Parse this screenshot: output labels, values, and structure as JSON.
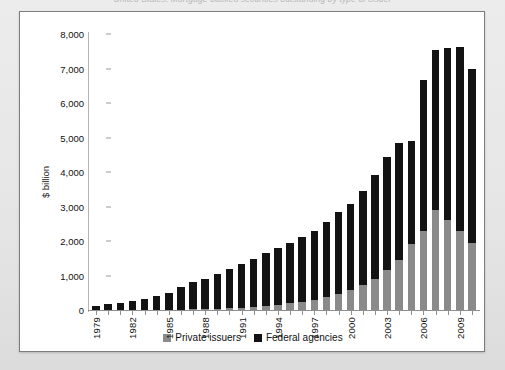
{
  "page": {
    "clipped_caption": "United States: Mortgage-backed securities outstanding by type of issuer"
  },
  "chart_data": {
    "type": "bar",
    "stacked": true,
    "title": "",
    "xlabel": "",
    "ylabel": "$ billion",
    "ylim": [
      0,
      8000
    ],
    "yticks": [
      0,
      1000,
      2000,
      3000,
      4000,
      5000,
      6000,
      7000,
      8000
    ],
    "ytick_labels": [
      "0",
      "1,000",
      "2,000",
      "3,000",
      "4,000",
      "5,000",
      "6,000",
      "7,000",
      "8,000"
    ],
    "grid": false,
    "legend_position": "bottom",
    "categories": [
      "1979",
      "1980",
      "1981",
      "1982",
      "1983",
      "1984",
      "1985",
      "1986",
      "1987",
      "1988",
      "1989",
      "1990",
      "1991",
      "1992",
      "1993",
      "1994",
      "1995",
      "1996",
      "1997",
      "1998",
      "1999",
      "2000",
      "2001",
      "2002",
      "2003",
      "2004",
      "2005",
      "2006",
      "2007",
      "2008",
      "2009",
      "2010"
    ],
    "xtick_labels": [
      "1979",
      "1982",
      "1985",
      "1988",
      "1991",
      "1994",
      "1997",
      "2000",
      "2003",
      "2006",
      "2009"
    ],
    "series": [
      {
        "name": "Private issuers",
        "color": "#8a8a8a",
        "values": [
          0,
          0,
          0,
          0,
          0,
          0,
          0,
          10,
          20,
          30,
          40,
          55,
          70,
          90,
          120,
          150,
          190,
          240,
          300,
          380,
          470,
          580,
          720,
          900,
          1150,
          1450,
          1900,
          2300,
          2900,
          2600,
          2300,
          1950
        ]
      },
      {
        "name": "Federal agencies",
        "color": "#131313",
        "values": [
          120,
          160,
          190,
          250,
          330,
          400,
          500,
          660,
          790,
          880,
          1000,
          1120,
          1260,
          1390,
          1540,
          1640,
          1760,
          1890,
          2000,
          2180,
          2360,
          2500,
          2740,
          3000,
          3280,
          3400,
          3000,
          4370,
          4650,
          4990,
          5310,
          5030
        ]
      }
    ],
    "legend": [
      {
        "label": "Private issuers",
        "color": "#8a8a8a"
      },
      {
        "label": "Federal agencies",
        "color": "#131313"
      }
    ]
  }
}
